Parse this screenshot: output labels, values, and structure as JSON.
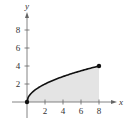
{
  "chart_data": {
    "type": "area",
    "title": "",
    "xlabel": "x",
    "ylabel": "y",
    "xlim": [
      0,
      8
    ],
    "ylim": [
      0,
      8
    ],
    "x_ticks": [
      2,
      4,
      6,
      8
    ],
    "y_ticks": [
      2,
      4,
      6,
      8
    ],
    "x_tick_labels": [
      "2",
      "4",
      "6",
      "8"
    ],
    "y_tick_labels": [
      "2",
      "4",
      "6",
      "8"
    ],
    "grid": false,
    "series": [
      {
        "name": "y = sqrt(2x)",
        "function": "sqrt(2x)",
        "domain": [
          0,
          8
        ],
        "points": [
          [
            0,
            0
          ],
          [
            0.5,
            1
          ],
          [
            2,
            2
          ],
          [
            4.5,
            3
          ],
          [
            8,
            4
          ]
        ],
        "endpoints": [
          [
            0,
            0
          ],
          [
            8,
            4
          ]
        ],
        "shaded_to_x_axis": true
      }
    ],
    "colors": {
      "curve": "#111111",
      "fill": "#e4e4e4",
      "axis": "#666666"
    }
  }
}
